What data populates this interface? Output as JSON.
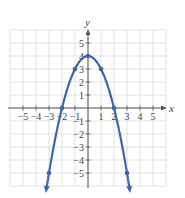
{
  "chart_data": {
    "type": "line",
    "title": "",
    "function": "y = 4 - x^2",
    "xlabel": "x",
    "ylabel": "y",
    "xlim": [
      -6,
      6
    ],
    "ylim": [
      -6,
      6
    ],
    "grid": true,
    "x_ticks": [
      -5,
      -4,
      -3,
      -2,
      -1,
      1,
      2,
      3,
      4,
      5
    ],
    "y_ticks": [
      5,
      4,
      3,
      2,
      1,
      -1,
      -2,
      -3,
      -4,
      -5
    ],
    "x_tick_labels": [
      "−5",
      "−4",
      "−3",
      "−2",
      "−1",
      "1",
      "2",
      "3",
      "4",
      "5"
    ],
    "y_tick_labels": [
      "5",
      "4",
      "3",
      "2",
      "1",
      "−1",
      "−2",
      "−3",
      "−4",
      "−5"
    ],
    "series": [
      {
        "name": "parabola",
        "color": "#3d68a8",
        "points": [
          {
            "x": -3,
            "y": -5
          },
          {
            "x": -2,
            "y": 0
          },
          {
            "x": -1,
            "y": 3
          },
          {
            "x": 0,
            "y": 4
          },
          {
            "x": 1,
            "y": 3
          },
          {
            "x": 2,
            "y": 0
          },
          {
            "x": 3,
            "y": -5
          }
        ],
        "arrows_at_ends": true
      }
    ]
  },
  "colors": {
    "curve": "#3d68a8",
    "grid": "#d9d9d9",
    "axis": "#555555"
  }
}
